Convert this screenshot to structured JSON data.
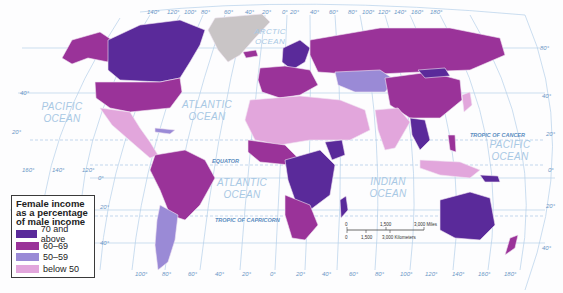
{
  "legend": {
    "title": "Female income as a percentage of male income",
    "title_lines": [
      "Female income",
      "as a percentage",
      "of male income"
    ],
    "items": [
      {
        "label": "70 and above",
        "color": "#5a2a9a"
      },
      {
        "label": "60–69",
        "color": "#9a3399"
      },
      {
        "label": "50–59",
        "color": "#9a8ad6"
      },
      {
        "label": "below 50",
        "color": "#e2a6dc"
      }
    ],
    "no_data_color": "#c9c5c6"
  },
  "oceans": [
    {
      "name": "PACIFIC",
      "line2": "OCEAN",
      "position": "north-east pacific"
    },
    {
      "name": "ATLANTIC",
      "line2": "OCEAN",
      "position": "north atlantic"
    },
    {
      "name": "ATLANTIC",
      "line2": "OCEAN",
      "position": "south atlantic"
    },
    {
      "name": "ARCTIC",
      "line2": "OCEAN",
      "position": "arctic"
    },
    {
      "name": "INDIAN",
      "line2": "OCEAN",
      "position": "indian"
    },
    {
      "name": "PACIFIC",
      "line2": "OCEAN",
      "position": "west pacific"
    }
  ],
  "special_lines": {
    "tropic_of_cancer": "TROPIC OF CANCER",
    "equator": "EQUATOR",
    "tropic_of_capricorn": "TROPIC OF CAPRICORN"
  },
  "latitude_labels": {
    "left": [
      "40°",
      "20°",
      "0°",
      "20°",
      "40°"
    ],
    "right": [
      "80°",
      "40°",
      "20°",
      "0°",
      "20°",
      "40°"
    ]
  },
  "longitude_labels": {
    "top": [
      "140°",
      "120°",
      "100°",
      "80°",
      "60°",
      "40°",
      "20°",
      "0°",
      "20°",
      "40°",
      "60°",
      "80°",
      "100°",
      "120°",
      "140°",
      "160°",
      "180°"
    ],
    "middle_left": [
      "160°",
      "140°",
      "120°"
    ],
    "bottom": [
      "100°",
      "80°",
      "60°",
      "40°",
      "20°",
      "0°",
      "20°",
      "40°",
      "60°",
      "80°",
      "100°",
      "120°",
      "140°",
      "160°",
      "180°"
    ]
  },
  "scale": {
    "miles": [
      "0",
      "1,500",
      "3,000 Miles"
    ],
    "kilometers": [
      "0",
      "1,500",
      "3,000 Kilometers"
    ]
  },
  "colors": {
    "graticule": "#b5d0ea",
    "ocean_text": "#a8c8e4",
    "background": "#fdfdfe"
  }
}
